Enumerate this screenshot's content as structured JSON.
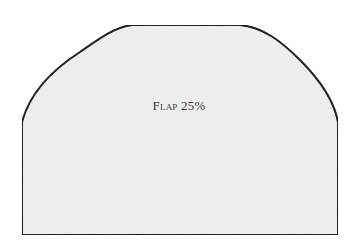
{
  "pattern": {
    "piece_name": "Flap",
    "percentage": "25%",
    "fill_color": "#efefef",
    "stroke_color": "#111111"
  }
}
